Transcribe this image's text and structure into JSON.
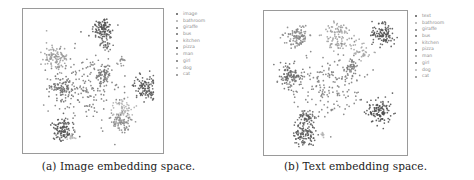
{
  "figure": {
    "panels": [
      {
        "id": "a",
        "caption": "(a) Image embedding space.",
        "frame": {
          "left": 22,
          "top": 8,
          "width": 142,
          "height": 146
        },
        "legend": {
          "left": 176,
          "top": 11
        },
        "legend_items": [
          "image",
          "bathroom",
          "giraffe",
          "bus",
          "kitchen",
          "pizza",
          "man",
          "girl",
          "dog",
          "cat"
        ]
      },
      {
        "id": "b",
        "caption": "(b) Text embedding space.",
        "frame": {
          "left": 26,
          "top": 10,
          "width": 145,
          "height": 146
        },
        "legend": {
          "left": 178,
          "top": 13
        },
        "legend_items": [
          "text",
          "bathroom",
          "giraffe",
          "bus",
          "kitchen",
          "pizza",
          "man",
          "girl",
          "dog",
          "cat"
        ]
      }
    ]
  },
  "chart_data": [
    {
      "type": "scatter",
      "title": "(a) Image embedding space.",
      "xlabel": "",
      "ylabel": "",
      "grid": false,
      "legend_position": "outside-right",
      "axis_ticks": false,
      "series_colors": [
        "#555555",
        "#a8a8a8",
        "#7a7a7a",
        "#6a6a6a",
        "#8f8f8f",
        "#4f4f4f",
        "#9a9a9a",
        "#717171",
        "#b5b5b5",
        "#858585"
      ],
      "clusters": [
        {
          "series": "bathroom",
          "cx": 0.58,
          "cy": 0.1,
          "r": 0.08,
          "n": 110,
          "shade": "#555555"
        },
        {
          "series": "bathroom",
          "cx": 0.6,
          "cy": 0.22,
          "r": 0.05,
          "n": 25,
          "shade": "#666666"
        },
        {
          "series": "giraffe",
          "cx": 0.2,
          "cy": 0.32,
          "r": 0.09,
          "n": 110,
          "shade": "#9a9a9a"
        },
        {
          "series": "bus",
          "cx": 0.25,
          "cy": 0.56,
          "r": 0.09,
          "n": 90,
          "shade": "#6e6e6e"
        },
        {
          "series": "kitchen",
          "cx": 0.92,
          "cy": 0.55,
          "r": 0.08,
          "n": 110,
          "shade": "#5a5a5a"
        },
        {
          "series": "pizza",
          "cx": 0.26,
          "cy": 0.87,
          "r": 0.08,
          "n": 110,
          "shade": "#555555"
        },
        {
          "series": "man",
          "cx": 0.73,
          "cy": 0.82,
          "r": 0.07,
          "n": 80,
          "shade": "#8a8a8a"
        },
        {
          "series": "girl",
          "cx": 0.74,
          "cy": 0.7,
          "r": 0.07,
          "n": 50,
          "shade": "#b0b0b0"
        },
        {
          "series": "dog",
          "cx": 0.33,
          "cy": 0.93,
          "r": 0.03,
          "n": 15,
          "shade": "#b8b8b8"
        },
        {
          "series": "cat",
          "cx": 0.58,
          "cy": 0.45,
          "r": 0.07,
          "n": 60,
          "shade": "#777777"
        },
        {
          "series": "image",
          "cx": 0.45,
          "cy": 0.55,
          "r": 0.25,
          "n": 170,
          "shade": "#7c7c7c"
        },
        {
          "series": "man",
          "cx": 0.73,
          "cy": 0.35,
          "r": 0.04,
          "n": 15,
          "shade": "#8d8d8d"
        }
      ]
    },
    {
      "type": "scatter",
      "title": "(b) Text embedding space.",
      "xlabel": "",
      "ylabel": "",
      "grid": false,
      "legend_position": "outside-right",
      "axis_ticks": false,
      "series_colors": [
        "#555555",
        "#a8a8a8",
        "#7a7a7a",
        "#6a6a6a",
        "#8f8f8f",
        "#4f4f4f",
        "#9a9a9a",
        "#717171",
        "#b5b5b5",
        "#858585"
      ],
      "clusters": [
        {
          "series": "giraffe",
          "cx": 0.2,
          "cy": 0.14,
          "r": 0.08,
          "n": 110,
          "shade": "#8a8a8a"
        },
        {
          "series": "kitchen",
          "cx": 0.52,
          "cy": 0.14,
          "r": 0.1,
          "n": 90,
          "shade": "#9e9e9e"
        },
        {
          "series": "bathroom",
          "cx": 0.88,
          "cy": 0.13,
          "r": 0.08,
          "n": 110,
          "shade": "#555555"
        },
        {
          "series": "bus",
          "cx": 0.14,
          "cy": 0.45,
          "r": 0.08,
          "n": 110,
          "shade": "#6a6a6a"
        },
        {
          "series": "cat",
          "cx": 0.63,
          "cy": 0.38,
          "r": 0.05,
          "n": 40,
          "shade": "#7a7a7a"
        },
        {
          "series": "pizza",
          "cx": 0.85,
          "cy": 0.72,
          "r": 0.09,
          "n": 120,
          "shade": "#505050"
        },
        {
          "series": "man",
          "cx": 0.27,
          "cy": 0.76,
          "r": 0.06,
          "n": 60,
          "shade": "#606060"
        },
        {
          "series": "dog",
          "cx": 0.25,
          "cy": 0.9,
          "r": 0.08,
          "n": 110,
          "shade": "#5c5c5c"
        },
        {
          "series": "girl",
          "cx": 0.4,
          "cy": 0.9,
          "r": 0.015,
          "n": 10,
          "shade": "#b5b5b5"
        },
        {
          "series": "text",
          "cx": 0.45,
          "cy": 0.52,
          "r": 0.25,
          "n": 180,
          "shade": "#808080"
        },
        {
          "series": "kitchen",
          "cx": 0.7,
          "cy": 0.25,
          "r": 0.08,
          "n": 40,
          "shade": "#a5a5a5"
        }
      ]
    }
  ]
}
